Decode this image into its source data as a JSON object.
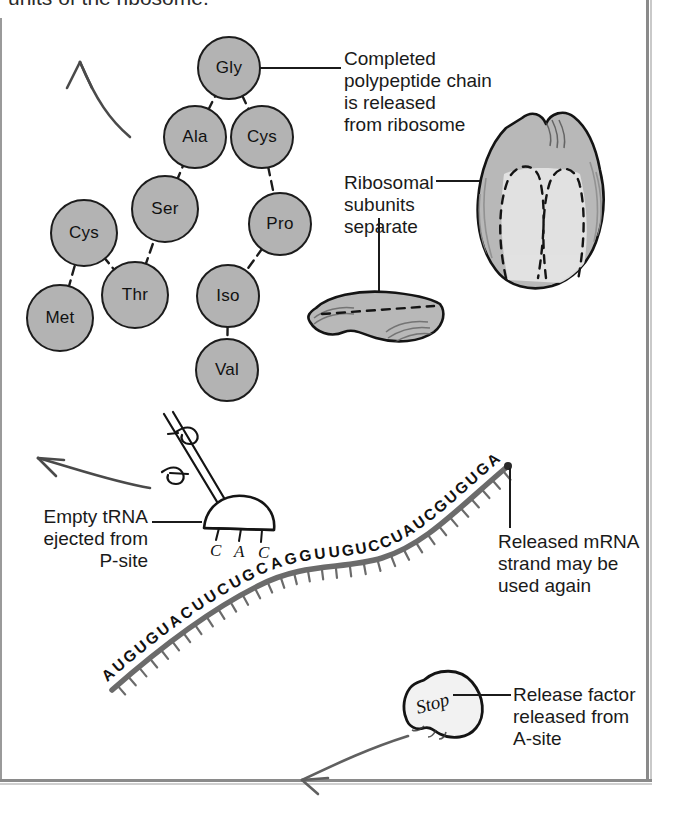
{
  "figure": {
    "caption_cut_top": "units of the ribosome.",
    "topic": "Termination of translation"
  },
  "polypeptide": {
    "label": "completed-polypeptide-chain",
    "residues": [
      {
        "name": "Met",
        "x": 60,
        "y": 318
      },
      {
        "name": "Cys",
        "x": 84,
        "y": 233
      },
      {
        "name": "Thr",
        "x": 135,
        "y": 295
      },
      {
        "name": "Ser",
        "x": 165,
        "y": 209
      },
      {
        "name": "Ala",
        "x": 195,
        "y": 137
      },
      {
        "name": "Gly",
        "x": 229,
        "y": 68
      },
      {
        "name": "Cys",
        "x": 262,
        "y": 137
      },
      {
        "name": "Pro",
        "x": 280,
        "y": 224
      },
      {
        "name": "Iso",
        "x": 228,
        "y": 296
      },
      {
        "name": "Val",
        "x": 227,
        "y": 370
      }
    ],
    "bonds": [
      [
        0,
        1
      ],
      [
        1,
        2
      ],
      [
        2,
        3
      ],
      [
        3,
        4
      ],
      [
        4,
        5
      ],
      [
        5,
        6
      ],
      [
        6,
        7
      ],
      [
        7,
        8
      ],
      [
        8,
        9
      ]
    ]
  },
  "annotations": {
    "completed_chain": {
      "lines": [
        "Completed",
        "polypeptide chain",
        "is released",
        "from ribosome"
      ],
      "target": "gly-residue"
    },
    "ribosomal_subunits": {
      "lines": [
        "Ribosomal",
        "subunits",
        "separate"
      ],
      "target": "large-ribosomal-subunit"
    },
    "empty_trna": {
      "lines": [
        "Empty tRNA",
        "ejected from",
        "P-site"
      ],
      "target": "trna-molecule"
    },
    "released_mrna": {
      "lines": [
        "Released mRNA",
        "strand may be",
        "used again"
      ],
      "target": "mrna-strand"
    },
    "release_factor": {
      "lines": [
        "Release factor",
        "released from",
        "A-site"
      ],
      "target": "release-factor"
    }
  },
  "mrna": {
    "label": "mRNA strand",
    "sequence": "AUGUGUACUUCUGCAGGUUGUCCUAUCGUGUGA",
    "bases": [
      "A",
      "U",
      "G",
      "U",
      "G",
      "U",
      "A",
      "C",
      "U",
      "U",
      "C",
      "U",
      "G",
      "C",
      "A",
      "G",
      "G",
      "U",
      "U",
      "G",
      "U",
      "C",
      "C",
      "U",
      "A",
      "U",
      "C",
      "G",
      "U",
      "G",
      "U",
      "G",
      "A"
    ]
  },
  "trna": {
    "label": "Empty tRNA",
    "anticodon": [
      "C",
      "A",
      "C"
    ],
    "anticodon_text": "C A C"
  },
  "release_factor": {
    "label": "Stop",
    "site": "A-site"
  },
  "ribosome": {
    "large_subunit": "large-ribosomal-subunit",
    "small_subunit": "small-ribosomal-subunit"
  },
  "arrows": {
    "polypeptide_arrow": "up-left",
    "trna_arrow": "left",
    "release_factor_arrow": "down-left"
  },
  "colors": {
    "amino_acid_fill": "#b3b3b3",
    "outline": "#1c1c1c",
    "subunit_fill": "#b8b8b8",
    "subunit_light": "#e2e2e2",
    "mrna_stroke": "#6b6b6b",
    "text": "#1a1a1a",
    "frame": "#8a8a8a"
  }
}
